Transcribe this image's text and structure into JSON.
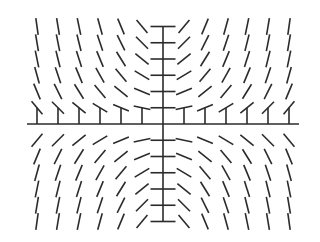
{
  "diagram": {
    "title": "",
    "type": "slope_field",
    "equation": "dy/dx = k*x*y",
    "k_screen": 0.2,
    "background": "#ffffff",
    "stroke_color": "#2b2b2b",
    "axes": {
      "origin_px": [
        163,
        124
      ],
      "x_axis_px": [
        27,
        299
      ],
      "y_axis_px": [
        26,
        221
      ],
      "x_unit_px": 21,
      "y_unit_px": 16.25,
      "x_ticks": [
        -6,
        -5,
        -4,
        -3,
        -2,
        -1,
        1,
        2,
        3,
        4,
        5,
        6
      ],
      "y_ticks": [
        -6,
        -5,
        -4,
        -3,
        -2,
        -1,
        1,
        2,
        3,
        4,
        5,
        6
      ]
    },
    "grid": {
      "x_range": [
        -6,
        6
      ],
      "y_range": [
        -6,
        6
      ],
      "segment_length_px": 17,
      "center_column_segment_length_px": 25
    }
  }
}
